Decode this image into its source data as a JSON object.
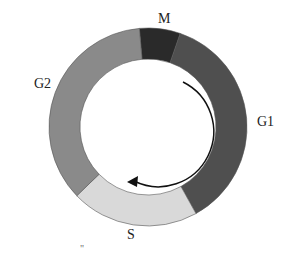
{
  "diagram": {
    "phases": [
      {
        "id": "M",
        "label": "M",
        "color": "#2a2a2a",
        "start_deg": -95,
        "end_deg": -71
      },
      {
        "id": "G1",
        "label": "G1",
        "color": "#4f4f4f",
        "start_deg": -71,
        "end_deg": 61
      },
      {
        "id": "S",
        "label": "S",
        "color": "#d9d9d9",
        "start_deg": 61,
        "end_deg": 136
      },
      {
        "id": "G2",
        "label": "G2",
        "color": "#8a8a8a",
        "start_deg": 136,
        "end_deg": 265
      }
    ],
    "arrow": {
      "direction": "clockwise",
      "color": "#111111"
    },
    "stray_mark": "\""
  }
}
